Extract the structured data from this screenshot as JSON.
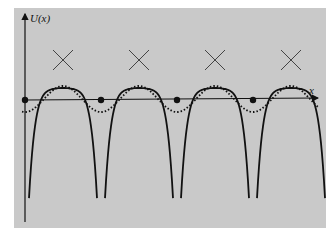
{
  "figure": {
    "y_axis_label": "U(x)",
    "x_axis_label": "x",
    "background": "#c9c9c9",
    "ink": "#111111",
    "atom_positions_x": [
      25,
      101,
      177,
      253
    ],
    "crossing_positions_x": [
      62,
      138,
      214,
      290
    ],
    "period_px": 76,
    "axis_y": 100,
    "curves": [
      {
        "name": "isolated-atom-potentials",
        "style": "thin-solid"
      },
      {
        "name": "crystal-potential",
        "style": "thick-solid"
      },
      {
        "name": "effective-potential",
        "style": "dotted"
      }
    ]
  }
}
